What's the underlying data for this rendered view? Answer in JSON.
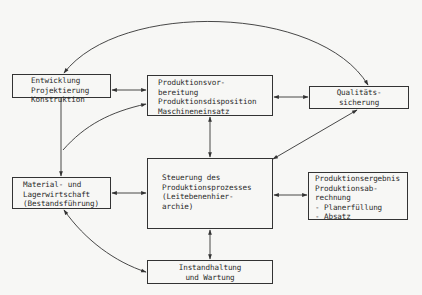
{
  "diagram": {
    "type": "flow-diagram",
    "language": "de",
    "line_color": "#333333",
    "nodes": [
      {
        "id": "entw",
        "lines": [
          "Entwicklung",
          "Projektierung",
          "Konstruktion"
        ]
      },
      {
        "id": "prodv",
        "lines": [
          "Produktionsvor-",
          "bereitung",
          "Produktionsdisposition",
          "Maschineneinsatz"
        ]
      },
      {
        "id": "qual",
        "lines": [
          "Qualitäts-",
          "sicherung"
        ]
      },
      {
        "id": "mat",
        "lines": [
          "Material- und",
          "Lagerwirtschaft",
          "(Bestandsführung)"
        ]
      },
      {
        "id": "steu",
        "lines": [
          "Steuerung des",
          "Produktionsprozesses",
          "(Leitebenenhier-",
          "archie)"
        ]
      },
      {
        "id": "erg",
        "lines": [
          "Produktionsergebnis",
          "Produktionsab-",
          "rechnung",
          "- Planerfüllung",
          "- Absatz"
        ]
      },
      {
        "id": "inst",
        "lines": [
          "Instandhaltung",
          "und Wartung"
        ]
      }
    ],
    "edges": [
      {
        "from": "entw",
        "to": "prodv",
        "direction": "both"
      },
      {
        "from": "prodv",
        "to": "qual",
        "direction": "both"
      },
      {
        "from": "qual",
        "to": "entw",
        "direction": "forward",
        "shape": "arc-top"
      },
      {
        "from": "entw",
        "to": "mat",
        "direction": "forward"
      },
      {
        "from": "mat",
        "to": "prodv",
        "direction": "forward",
        "shape": "curve"
      },
      {
        "from": "prodv",
        "to": "steu",
        "direction": "both"
      },
      {
        "from": "steu",
        "to": "qual",
        "direction": "both"
      },
      {
        "from": "mat",
        "to": "steu",
        "direction": "both"
      },
      {
        "from": "steu",
        "to": "erg",
        "direction": "both"
      },
      {
        "from": "steu",
        "to": "inst",
        "direction": "both"
      },
      {
        "from": "mat",
        "to": "inst",
        "direction": "both",
        "shape": "curve"
      }
    ]
  }
}
